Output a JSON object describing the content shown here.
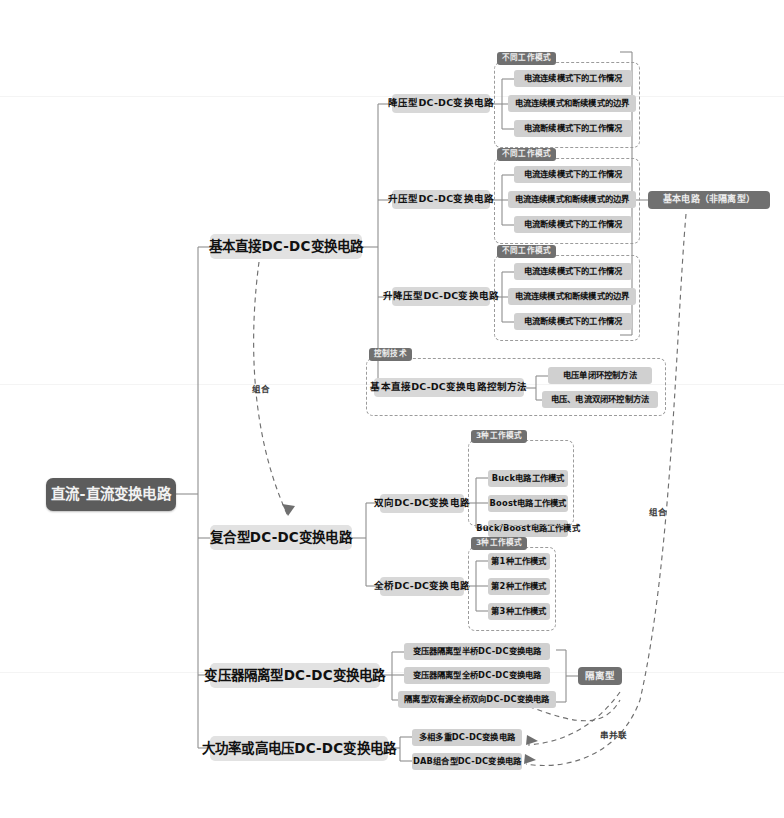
{
  "diagram": {
    "title": "直流-直流变换电路",
    "colors": {
      "root_bg": "#5c5c5c",
      "level1_bg": "#e2e2e2",
      "level2_bg": "#d8d8d8",
      "level3_bg": "#d0d0d0",
      "group_label_bg": "#707070",
      "line": "#8e8e8e",
      "dashed": "#9b9b9b",
      "page_bg": "#ffffff"
    },
    "root": {
      "label": "直流-直流变换电路"
    },
    "branches": [
      {
        "label": "基本直接DC-DC变换电路",
        "children": [
          {
            "label": "降压型DC-DC变换电路",
            "group_label": "不同工作模式",
            "leaves": [
              "电流连续模式下的工作情况",
              "电流连续模式和断续模式的边界",
              "电流断续模式下的工作情况"
            ]
          },
          {
            "label": "升压型DC-DC变换电路",
            "group_label": "不同工作模式",
            "leaves": [
              "电流连续模式下的工作情况",
              "电流连续模式和断续模式的边界",
              "电流断续模式下的工作情况"
            ]
          },
          {
            "label": "升降压型DC-DC变换电路",
            "group_label": "不同工作模式",
            "leaves": [
              "电流连续模式下的工作情况",
              "电流连续模式和断续模式的边界",
              "电流断续模式下的工作情况"
            ]
          },
          {
            "label": "基本直接DC-DC变换电路控制方法",
            "group_label": "控制技术",
            "leaves": [
              "电压单闭环控制方法",
              "电压、电流双闭环控制方法"
            ]
          }
        ]
      },
      {
        "label": "复合型DC-DC变换电路",
        "children": [
          {
            "label": "双向DC-DC变换电路",
            "group_label": "3种工作模式",
            "leaves": [
              "Buck电路工作模式",
              "Boost电路工作模式",
              "Buck/Boost电路工作模式"
            ]
          },
          {
            "label": "全桥DC-DC变换电路",
            "group_label": "3种工作模式",
            "leaves": [
              "第1种工作模式",
              "第2种工作模式",
              "第3种工作模式"
            ]
          }
        ]
      },
      {
        "label": "变压器隔离型DC-DC变换电路",
        "children": [],
        "leaves": [
          "变压器隔离型半桥DC-DC变换电路",
          "变压器隔离型全桥DC-DC变换电路",
          "隔离型双有源全桥双向DC-DC变换电路"
        ]
      },
      {
        "label": "大功率或高电压DC-DC变换电路",
        "children": [],
        "leaves": [
          "多相多重DC-DC变换电路",
          "DAB组合型DC-DC变换电路"
        ]
      }
    ],
    "side_labels": [
      {
        "label": "基本电路（非隔离型）",
        "name": "basic-nonisolated-label"
      },
      {
        "label": "隔离型",
        "name": "isolated-label"
      }
    ],
    "annotations": [
      {
        "label": "组合",
        "name": "combine-annotation-left"
      },
      {
        "label": "组合",
        "name": "combine-annotation-right"
      },
      {
        "label": "串并联",
        "name": "series-parallel-annotation"
      }
    ]
  }
}
